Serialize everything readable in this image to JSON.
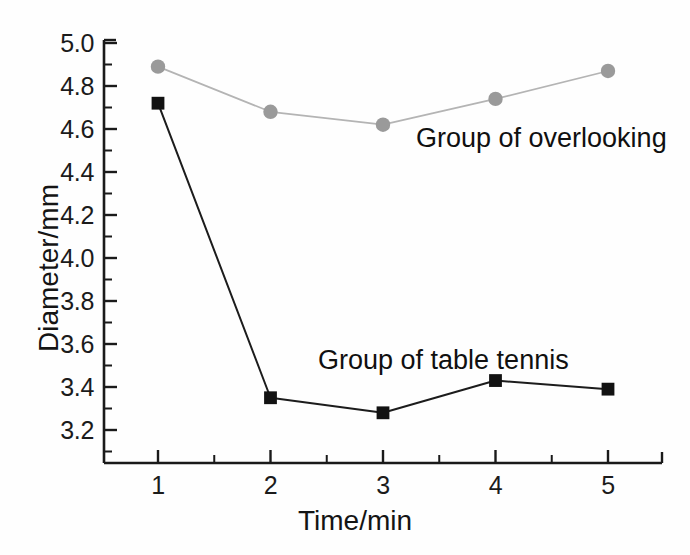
{
  "chart_data": {
    "type": "line",
    "title": "",
    "subtitle": "",
    "xlabel": "Time/min",
    "ylabel": "Diameter/mm",
    "x": [
      1,
      2,
      3,
      4,
      5
    ],
    "xlim": [
      0.55,
      5.5
    ],
    "ylim": [
      3.05,
      5.0
    ],
    "xticks": [
      "1",
      "2",
      "3",
      "4",
      "5"
    ],
    "yticks": [
      "3.2",
      "3.4",
      "3.6",
      "3.8",
      "4.0",
      "4.2",
      "4.4",
      "4.6",
      "4.8",
      "5.0"
    ],
    "ytick_values": [
      3.2,
      3.4,
      3.6,
      3.8,
      4.0,
      4.2,
      4.4,
      4.6,
      4.8,
      5.0
    ],
    "minor_ticks": true,
    "grid": false,
    "legend_position": "inline-annotations",
    "series": [
      {
        "name": "Group of overlooking",
        "marker": "circle",
        "color": "#9a9a9a",
        "line_color": "#b4b4b4",
        "values": [
          4.89,
          4.68,
          4.62,
          4.74,
          4.87
        ]
      },
      {
        "name": "Group of table tennis",
        "marker": "square",
        "color": "#121212",
        "line_color": "#1c1c1c",
        "values": [
          4.72,
          3.35,
          3.28,
          3.43,
          3.39
        ]
      }
    ],
    "annotations": [
      {
        "text": "Group of overlooking",
        "series": "Group of overlooking"
      },
      {
        "text": "Group of table tennis",
        "series": "Group of table tennis"
      }
    ],
    "axis_color": "#1a1a1a",
    "background": "#fefefe"
  }
}
